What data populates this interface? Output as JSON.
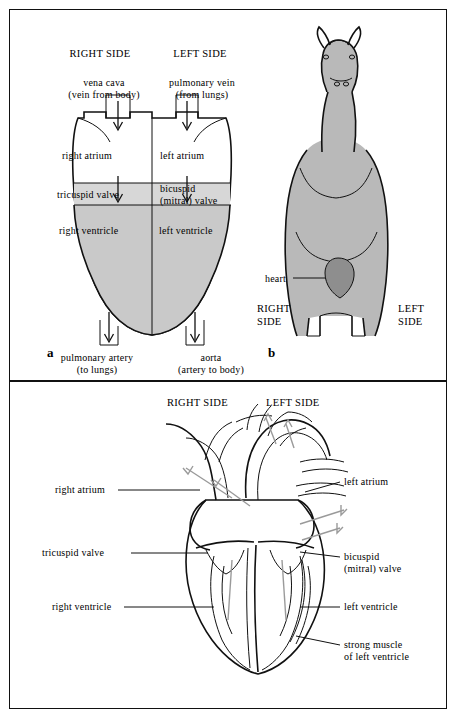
{
  "figure": {
    "panel_a": {
      "letter": "a",
      "headers": {
        "right": "RIGHT SIDE",
        "left": "LEFT SIDE"
      },
      "labels": {
        "vena_cava_l1": "vena cava",
        "vena_cava_l2": "(vein from body)",
        "pulmonary_vein_l1": "pulmonary vein",
        "pulmonary_vein_l2": "(from lungs)",
        "right_atrium": "right atrium",
        "left_atrium": "left atrium",
        "tricuspid_valve": "tricuspid valve",
        "bicuspid_l1": "bicuspid",
        "bicuspid_l2": "(mitral) valve",
        "right_ventricle": "right ventricle",
        "left_ventricle": "left ventricle",
        "pulmonary_artery_l1": "pulmonary artery",
        "pulmonary_artery_l2": "(to lungs)",
        "aorta_l1": "aorta",
        "aorta_l2": "(artery to body)"
      }
    },
    "panel_b": {
      "letter": "b",
      "labels": {
        "heart": "heart",
        "right_l1": "RIGHT",
        "right_l2": "SIDE",
        "left_l1": "LEFT",
        "left_l2": "SIDE"
      }
    },
    "panel_c": {
      "headers": {
        "right": "RIGHT SIDE",
        "left": "LEFT SIDE"
      },
      "labels": {
        "right_atrium": "right atrium",
        "left_atrium": "left atrium",
        "tricuspid_valve": "tricuspid valve",
        "bicuspid_l1": "bicuspid",
        "bicuspid_l2": "(mitral) valve",
        "right_ventricle": "right ventricle",
        "left_ventricle": "left ventricle",
        "strong_muscle_l1": "strong muscle",
        "strong_muscle_l2": "of left ventricle"
      }
    }
  },
  "colors": {
    "ink": "#111111",
    "chamber_fill": "#c9c9c9",
    "horse_fill": "#b9b9b9",
    "heart_fill": "#8e8e8e"
  }
}
